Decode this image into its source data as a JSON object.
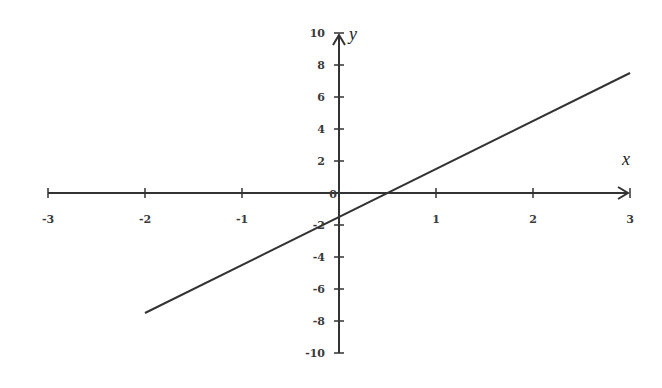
{
  "chart_data": {
    "type": "line",
    "title": "",
    "xlabel": "x",
    "ylabel": "y",
    "xlim": [
      -3,
      3
    ],
    "ylim": [
      -10,
      10
    ],
    "grid": false,
    "legend": null,
    "x_ticks": [
      -3,
      -2,
      -1,
      0,
      1,
      2,
      3
    ],
    "x_tick_labels": [
      "-3",
      "-2",
      "-1",
      "0",
      "1",
      "2",
      "3"
    ],
    "y_ticks": [
      -10,
      -8,
      -6,
      -4,
      -2,
      0,
      2,
      4,
      6,
      8,
      10
    ],
    "y_tick_labels": [
      "-10",
      "-8",
      "-6",
      "-4",
      "-2",
      "0",
      "2",
      "4",
      "6",
      "8",
      "10"
    ],
    "series": [
      {
        "name": "y = 3x - 1.5",
        "x": [
          -2,
          3
        ],
        "y": [
          -7.5,
          7.5
        ],
        "color": "#333333"
      }
    ],
    "annotations": []
  },
  "layout": {
    "origin_px": [
      339,
      193
    ],
    "x_unit_px": 97,
    "y_unit_px": 16,
    "axis_color": "#333333"
  }
}
